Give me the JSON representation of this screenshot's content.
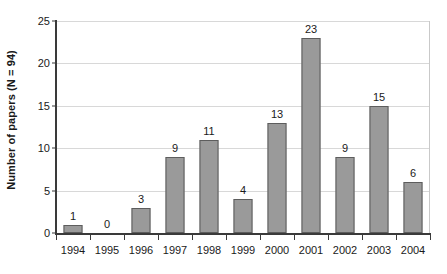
{
  "chart_data": {
    "type": "bar",
    "title": "",
    "subtitle": "",
    "xlabel": "",
    "ylabel": "Number of papers (N = 94)",
    "categories": [
      "1994",
      "1995",
      "1996",
      "1997",
      "1998",
      "1999",
      "2000",
      "2001",
      "2002",
      "2003",
      "2004"
    ],
    "values": [
      1,
      0,
      3,
      9,
      11,
      4,
      13,
      23,
      9,
      15,
      6
    ],
    "data_labels": [
      "1",
      "0",
      "3",
      "9",
      "11",
      "4",
      "13",
      "23",
      "9",
      "15",
      "6"
    ],
    "ylim": [
      0,
      25
    ],
    "y_ticks": [
      0,
      5,
      10,
      15,
      20,
      25
    ],
    "y_tick_labels": [
      "0",
      "5",
      "10",
      "15",
      "20",
      "25"
    ],
    "grid": "horizontal",
    "legend": "none",
    "total": 94,
    "colors": {
      "bar_fill": "#9a9a9a",
      "bar_border": "#5d5d5d",
      "gridline": "#d8d8d8",
      "axis": "#3a3a3a",
      "frame": "#c9c9c9",
      "text": "#1a1a1a",
      "background": "#ffffff"
    }
  }
}
